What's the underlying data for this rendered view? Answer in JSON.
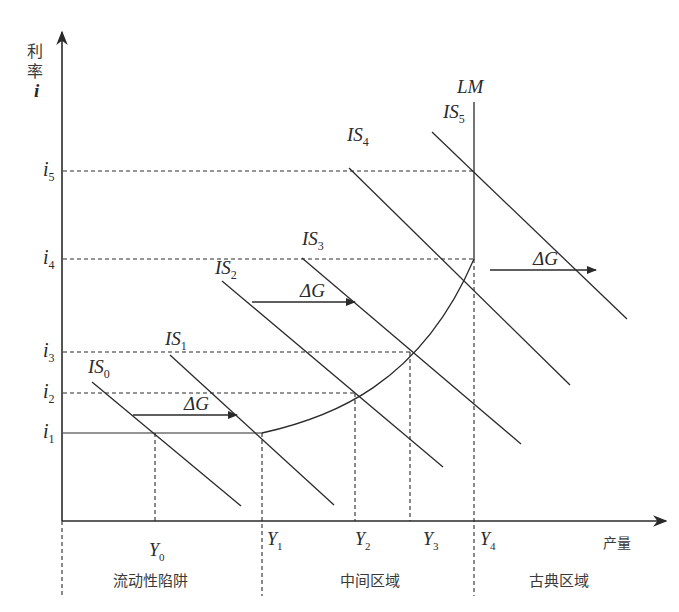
{
  "diagram": {
    "y_axis": {
      "label_line1": "利",
      "label_line2": "率",
      "label_var": "i"
    },
    "x_axis": {
      "label": "产量"
    },
    "interest_levels": [
      {
        "id": "i1",
        "base": "i",
        "sub": "1"
      },
      {
        "id": "i2",
        "base": "i",
        "sub": "2"
      },
      {
        "id": "i3",
        "base": "i",
        "sub": "3"
      },
      {
        "id": "i4",
        "base": "i",
        "sub": "4"
      },
      {
        "id": "i5",
        "base": "i",
        "sub": "5"
      }
    ],
    "output_levels": [
      {
        "id": "Y0",
        "base": "Y",
        "sub": "0"
      },
      {
        "id": "Y1",
        "base": "Y",
        "sub": "1"
      },
      {
        "id": "Y2",
        "base": "Y",
        "sub": "2"
      },
      {
        "id": "Y3",
        "base": "Y",
        "sub": "3"
      },
      {
        "id": "Y4",
        "base": "Y",
        "sub": "4"
      }
    ],
    "is_curves": [
      {
        "id": "IS0",
        "base": "IS",
        "sub": "0"
      },
      {
        "id": "IS1",
        "base": "IS",
        "sub": "1"
      },
      {
        "id": "IS2",
        "base": "IS",
        "sub": "2"
      },
      {
        "id": "IS3",
        "base": "IS",
        "sub": "3"
      },
      {
        "id": "IS4",
        "base": "IS",
        "sub": "4"
      },
      {
        "id": "IS5",
        "base": "IS",
        "sub": "5"
      }
    ],
    "lm_curve": {
      "label": "LM"
    },
    "shift_label": "ΔG",
    "regions": [
      {
        "id": "liquidity-trap",
        "label": "流动性陷阱"
      },
      {
        "id": "intermediate",
        "label": "中间区域"
      },
      {
        "id": "classical",
        "label": "古典区域"
      }
    ]
  }
}
